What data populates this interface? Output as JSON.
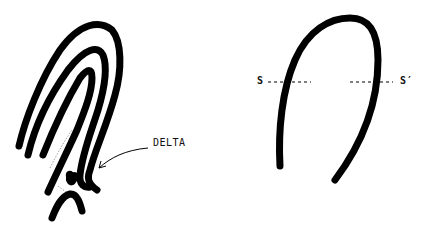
{
  "figure": {
    "left_panel": {
      "description": "Fingerprint loop pattern with ridges and a delta",
      "label_delta": "DELTA"
    },
    "right_panel": {
      "description": "Single ridge loop with section line",
      "label_s": "S",
      "label_s_prime": "S′"
    },
    "colors": {
      "ink": "#000000",
      "background": "#ffffff"
    }
  }
}
